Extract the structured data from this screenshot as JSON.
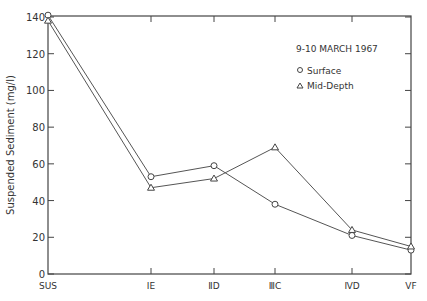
{
  "chart_data": {
    "type": "line",
    "title": "",
    "annotation": "9-10 MARCH 1967",
    "xlabel": "",
    "ylabel": "Suspended Sediment (mg/l)",
    "ylim": [
      0,
      140
    ],
    "yticks": [
      0,
      20,
      40,
      60,
      80,
      100,
      120,
      140
    ],
    "categories": [
      "SUS",
      "I E",
      "II D",
      "III C",
      "IV D",
      "V F"
    ],
    "x_display": [
      "SUS",
      "IE",
      "ⅡD",
      "ⅢC",
      "ⅣD",
      "ⅤF"
    ],
    "series": [
      {
        "name": "Surface",
        "marker": "circle",
        "values": [
          141,
          53,
          59,
          38,
          21,
          13
        ]
      },
      {
        "name": "Mid-Depth",
        "marker": "triangle",
        "values": [
          138,
          47,
          52,
          69,
          24,
          15
        ]
      }
    ],
    "legend_position": "upper right, inside",
    "grid": false
  }
}
